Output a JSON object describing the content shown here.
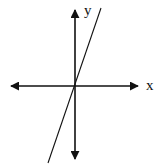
{
  "diagram": {
    "type": "coordinate-axes-with-line",
    "x_axis_label": "x",
    "y_axis_label": "y",
    "line": {
      "passes_through_origin": true,
      "slope_sign": "positive",
      "approx_slope": 3
    },
    "colors": {
      "ink": "#111111",
      "background": "#ffffff"
    }
  }
}
